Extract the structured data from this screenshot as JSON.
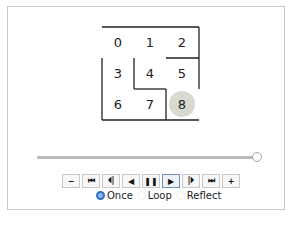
{
  "maze": {
    "cell_size": 32,
    "origin": [
      102,
      27
    ],
    "cells": [
      {
        "label": "0",
        "x": 102,
        "y": 35
      },
      {
        "label": "1",
        "x": 134,
        "y": 35
      },
      {
        "label": "2",
        "x": 166,
        "y": 35
      },
      {
        "label": "3",
        "x": 102,
        "y": 66
      },
      {
        "label": "4",
        "x": 134,
        "y": 66
      },
      {
        "label": "5",
        "x": 166,
        "y": 66
      },
      {
        "label": "6",
        "x": 102,
        "y": 97
      },
      {
        "label": "7",
        "x": 134,
        "y": 97
      },
      {
        "label": "8",
        "x": 166,
        "y": 97
      }
    ],
    "walls": [
      [
        102,
        27,
        199,
        27
      ],
      [
        199,
        27,
        199,
        89
      ],
      [
        166,
        58,
        199,
        58
      ],
      [
        102,
        58,
        102,
        120
      ],
      [
        134,
        58,
        134,
        89
      ],
      [
        134,
        89,
        166,
        89
      ],
      [
        166,
        89,
        166,
        120
      ],
      [
        102,
        120,
        199,
        120
      ]
    ],
    "agent": {
      "cell": "8",
      "cx": 182,
      "cy": 104,
      "r": 13,
      "color": "#d9d9d2"
    },
    "wall_color": "#222222"
  },
  "slider": {
    "value_pct": 100
  },
  "controls": {
    "buttons": [
      {
        "name": "slower-button",
        "glyph": "−",
        "icon": "minus-icon"
      },
      {
        "name": "first-frame-button",
        "glyph": "⏮",
        "icon": "skip-first-icon"
      },
      {
        "name": "step-back-button",
        "glyph": "⏴|",
        "icon": "step-back-icon"
      },
      {
        "name": "play-reverse-button",
        "glyph": "◀",
        "icon": "play-reverse-icon"
      },
      {
        "name": "pause-button",
        "glyph": "❚❚",
        "icon": "pause-icon"
      },
      {
        "name": "play-button",
        "glyph": "▶",
        "icon": "play-icon",
        "active": true
      },
      {
        "name": "step-forward-button",
        "glyph": "|⏵",
        "icon": "step-forward-icon"
      },
      {
        "name": "last-frame-button",
        "glyph": "⏭",
        "icon": "skip-last-icon"
      },
      {
        "name": "faster-button",
        "glyph": "+",
        "icon": "plus-icon"
      }
    ],
    "loop_options": [
      {
        "label": "Once",
        "selected": true
      },
      {
        "label": "Loop",
        "selected": false
      },
      {
        "label": "Reflect",
        "selected": false
      }
    ]
  }
}
